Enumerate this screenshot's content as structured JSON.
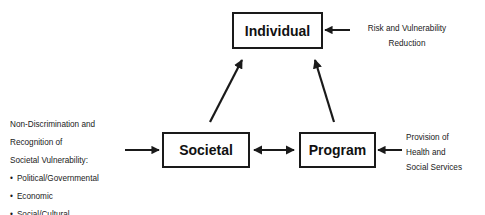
{
  "nodes": {
    "individual": {
      "label": "Individual"
    },
    "societal": {
      "label": "Societal"
    },
    "program": {
      "label": "Program"
    }
  },
  "inputs": {
    "individual": {
      "lines": [
        "Risk and Vulnerability",
        "Reduction"
      ]
    },
    "societal": {
      "lines": [
        "Non-Discrimination and",
        "Recognition of",
        "Societal Vulnerability:"
      ],
      "bullets": [
        "Political/Governmental",
        "Economic",
        "Social/Cultural"
      ]
    },
    "program": {
      "lines": [
        "Provision of",
        "Health and",
        "Social Services"
      ]
    }
  },
  "edges": [
    {
      "from": "societal",
      "to": "individual",
      "type": "directed"
    },
    {
      "from": "program",
      "to": "individual",
      "type": "directed"
    },
    {
      "from": "societal",
      "to": "program",
      "type": "bidirectional"
    },
    {
      "from": "input-individual",
      "to": "individual",
      "type": "directed"
    },
    {
      "from": "input-societal",
      "to": "societal",
      "type": "directed"
    },
    {
      "from": "input-program",
      "to": "program",
      "type": "directed"
    }
  ],
  "colors": {
    "stroke": "#1a1a1a",
    "background": "#ffffff"
  }
}
